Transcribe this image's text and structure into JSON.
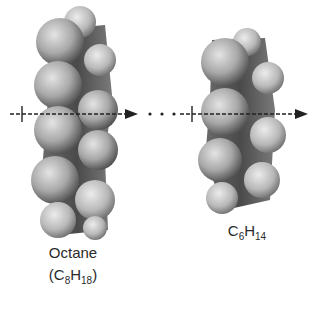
{
  "diagram": {
    "type": "space-filling molecular models with intermolecular axis",
    "molecules": [
      {
        "name": "Octane",
        "formula_prefix": "(C",
        "carbon_count": "8",
        "formula_mid": "H",
        "hydrogen_count": "18",
        "formula_suffix": ")",
        "carbon_atoms": 8
      },
      {
        "name": "",
        "formula_prefix": "C",
        "carbon_count": "6",
        "formula_mid": "H",
        "hydrogen_count": "14",
        "formula_suffix": "",
        "carbon_atoms": 6
      }
    ],
    "connector": {
      "style": "dashed arrow with ellipsis dots",
      "dots": 3
    },
    "colors": {
      "background": "#ffffff",
      "atom_light": "#d8d8d8",
      "atom_mid": "#9a9a9a",
      "atom_dark": "#3c3c3c",
      "axis": "#222222",
      "text": "#2a2a2a"
    }
  }
}
